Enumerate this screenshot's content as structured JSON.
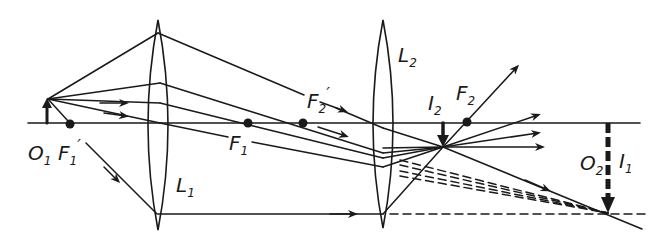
{
  "diagram": {
    "colors": {
      "ink": "#1a1a1a",
      "background": "#ffffff"
    },
    "labels": {
      "object_1": {
        "main": "O",
        "sub": "1"
      },
      "focus_1_front": {
        "main": "F",
        "sub": "1",
        "prime": "′"
      },
      "lens_1": {
        "main": "L",
        "sub": "1"
      },
      "focus_1_back": {
        "main": "F",
        "sub": "1"
      },
      "focus_2_front": {
        "main": "F",
        "sub": "2",
        "prime": "′"
      },
      "lens_2": {
        "main": "L",
        "sub": "2"
      },
      "image_2": {
        "main": "I",
        "sub": "2"
      },
      "focus_2_back": {
        "main": "F",
        "sub": "2"
      },
      "object_2": {
        "main": "O",
        "sub": "2"
      },
      "image_1": {
        "main": "I",
        "sub": "1"
      }
    },
    "elements": {
      "optical_axis": {
        "x1": 28,
        "x2": 640,
        "y": 123
      },
      "lens_1": {
        "cx": 158,
        "top": 20,
        "bottom": 230
      },
      "lens_2": {
        "cx": 383,
        "top": 20,
        "bottom": 228
      },
      "object_arrow": {
        "x": 47,
        "y_base": 123,
        "y_tip": 99
      },
      "focal_points": [
        {
          "name": "F1'",
          "x": 70,
          "y": 124
        },
        {
          "name": "F1",
          "x": 248,
          "y": 123
        },
        {
          "name": "F2'",
          "x": 303,
          "y": 123
        },
        {
          "name": "F2",
          "x": 467,
          "y": 122
        }
      ],
      "image_2_point": {
        "x": 443,
        "y": 147
      },
      "image_1_point": {
        "x": 608,
        "y": 213
      }
    }
  }
}
